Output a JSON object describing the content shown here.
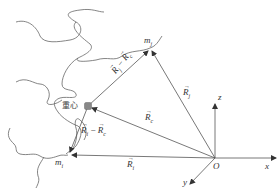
{
  "diagram": {
    "type": "vector-position-diagram",
    "colors": {
      "line": "#555555",
      "chain": "#666666",
      "center_marker": "#888888",
      "background": "#ffffff"
    },
    "labels": {
      "m_j": {
        "base": "m",
        "sub": "j"
      },
      "m_i": {
        "base": "m",
        "sub": "i"
      },
      "center_of_mass": "重心",
      "R_j": {
        "base": "R",
        "sub": "j"
      },
      "R_c": {
        "base": "R",
        "sub": "c"
      },
      "R_i": {
        "base": "R",
        "sub": "i"
      },
      "R_j_minus_R_c": {
        "a": "R",
        "a_sub": "j",
        "op": "−",
        "b": "R",
        "b_sub": "c"
      },
      "R_i_minus_R_c": {
        "a": "R",
        "a_sub": "i",
        "op": "−",
        "b": "R",
        "b_sub": "c"
      },
      "origin": "O",
      "axis_x": "x",
      "axis_y": "y",
      "axis_z": "z",
      "vector_arrow": "→"
    },
    "points": {
      "origin": [
        215,
        158
      ],
      "m_j": [
        150,
        48
      ],
      "m_i": [
        68,
        155
      ],
      "center": [
        88,
        106
      ]
    }
  }
}
